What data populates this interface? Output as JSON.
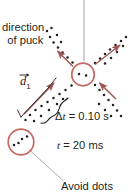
{
  "figure": {
    "kind": "physics-motion-diagram",
    "background_color": "#ffffff",
    "width": 132,
    "height": 196,
    "labels": {
      "direction_line1": "direction",
      "direction_line2": "of puck",
      "delta_t": "Δt = 0.10 s",
      "delta_t_symbol": "Δ",
      "delta_t_var": "t",
      "delta_t_value": " = 0.10 s",
      "time_var": "t",
      "time_value": " = 20 ms",
      "time_full": "t = 20 ms",
      "avoid_dots": "Avoid dots",
      "displacement_vector": "d",
      "displacement_subscript": "1"
    },
    "colors": {
      "circle_stroke": "#c66a63",
      "arrow_stroke": "#9e5a52",
      "dot_fill": "#231f20",
      "leader_line": "#a7a9ac",
      "brace_stroke": "#231f20",
      "text": "#231f20"
    },
    "circles": [
      {
        "name": "puck-circle-upper",
        "cx": 83,
        "cy": 74.5,
        "r": 11.5
      },
      {
        "name": "puck-circle-lower",
        "cx": 21,
        "cy": 142,
        "r": 13
      }
    ],
    "arrows": [
      {
        "name": "arrow-up-left",
        "x1": 74,
        "y1": 67,
        "x2": 56,
        "y2": 50
      },
      {
        "name": "arrow-up-right",
        "x1": 96,
        "y1": 64,
        "x2": 122,
        "y2": 44
      },
      {
        "name": "arrow-down-right-inward",
        "x1": 117,
        "y1": 100,
        "x2": 99,
        "y2": 83
      },
      {
        "name": "arrow-displacement-d1",
        "x1": 23,
        "y1": 115,
        "x2": 55,
        "y2": 82
      }
    ],
    "leader_lines": [
      {
        "name": "leader-vertical-top",
        "x1": 84,
        "y1": 0,
        "x2": 84,
        "y2": 62
      },
      {
        "name": "leader-avoid-dots",
        "x1": 30,
        "y1": 150,
        "x2": 64,
        "y2": 181
      }
    ],
    "dots_note": "sequence of strobe dots along four radial tracks from the central puck"
  }
}
